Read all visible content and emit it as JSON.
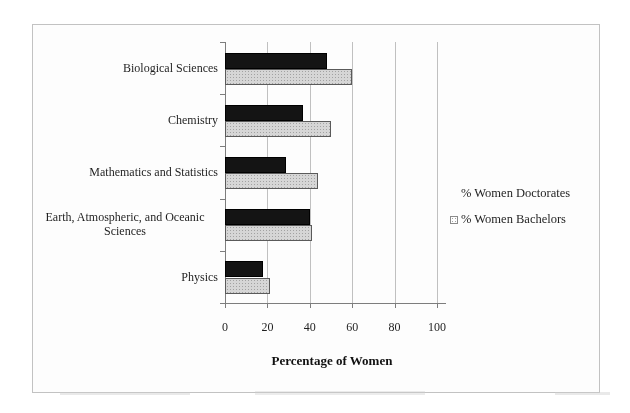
{
  "chart_data": {
    "type": "bar",
    "orientation": "horizontal",
    "title": "",
    "categories": [
      "Biological Sciences",
      "Chemistry",
      "Mathematics and Statistics",
      "Earth, Atmospheric, and Oceanic Sciences",
      "Physics"
    ],
    "series": [
      {
        "name": "% Women Doctorates",
        "color": "#141414",
        "values": [
          48,
          37,
          29,
          40,
          18
        ]
      },
      {
        "name": "% Women Bachelors",
        "color": "#d6d6d6",
        "values": [
          60,
          50,
          44,
          41,
          21
        ]
      }
    ],
    "xlabel": "Percentage of Women",
    "ylabel": "",
    "xlim": [
      0,
      100
    ],
    "xticks": [
      0,
      20,
      40,
      60,
      80,
      100
    ],
    "grid": "vertical",
    "legend_position": "right",
    "frame_border_color": "#c2c2c2",
    "gridline_color": "#c0c0c0",
    "axis_color": "#7d7d7d"
  },
  "legend": {
    "items": [
      {
        "label": "% Women Doctorates",
        "swatch": "black-square-icon"
      },
      {
        "label": "% Women Bachelors",
        "swatch": "gray-dotted-square-icon"
      }
    ]
  }
}
